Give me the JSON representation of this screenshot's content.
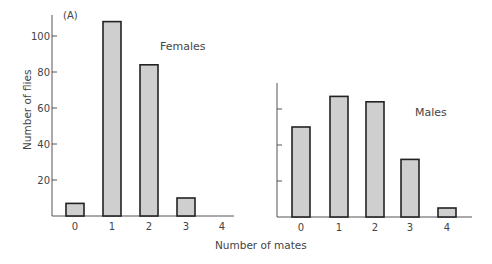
{
  "chart_data": [
    {
      "type": "bar",
      "panel": "(A)",
      "title": "Females",
      "categories": [
        "0",
        "1",
        "2",
        "3",
        "4"
      ],
      "values": [
        7,
        108,
        84,
        10,
        0
      ],
      "xlabel": "Number of mates",
      "ylabel": "Number of flies",
      "yticks": [
        20,
        40,
        60,
        80,
        100
      ],
      "ylim": [
        0,
        112
      ],
      "grid": false
    },
    {
      "type": "bar",
      "title": "Males",
      "categories": [
        "0",
        "1",
        "2",
        "3",
        "4"
      ],
      "values": [
        50,
        67,
        64,
        32,
        5
      ],
      "xlabel": "Number of mates",
      "ylabel": "Number of flies",
      "yticks": [
        20,
        40,
        60
      ],
      "ylim": [
        0,
        74
      ],
      "grid": false
    }
  ],
  "labels": {
    "panel": "(A)",
    "ylabel": "Number of flies",
    "xlabel": "Number of mates",
    "females": "Females",
    "males": "Males"
  },
  "colors": {
    "bar_fill": "#cfcfcf",
    "bar_stroke": "#222222",
    "axis": "#555555"
  }
}
